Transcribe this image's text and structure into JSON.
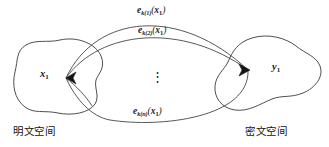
{
  "figure": {
    "background_color": "#ffffff",
    "stroke_color": "#3a3a3a",
    "text_color": "#1a1a1a"
  },
  "nodes": {
    "plaintext_point": {
      "base": "x",
      "subscript": "1",
      "full": "x1"
    },
    "ciphertext_point": {
      "base": "y",
      "subscript": "1",
      "full": "y1"
    }
  },
  "regions": {
    "plaintext_space": {
      "caption": "明文空间",
      "icon": "blob-shape"
    },
    "ciphertext_space": {
      "caption": "密文空间",
      "icon": "blob-shape"
    }
  },
  "arcs": [
    {
      "id": "arc-top",
      "label": {
        "func": "e",
        "key_sub": "k(1)",
        "open": "(",
        "arg": "x",
        "arg_sub": "1",
        "close": ")"
      }
    },
    {
      "id": "arc-middle",
      "label": {
        "func": "e",
        "key_sub": "k(2)",
        "open": "(",
        "arg": "x",
        "arg_sub": "1",
        "close": ")"
      }
    },
    {
      "id": "arc-bottom",
      "label": {
        "func": "e",
        "key_sub": "k(n)",
        "open": "(",
        "arg": "x",
        "arg_sub": "1",
        "close": ")"
      }
    }
  ],
  "ellipsis": {
    "glyph": "⋮"
  }
}
